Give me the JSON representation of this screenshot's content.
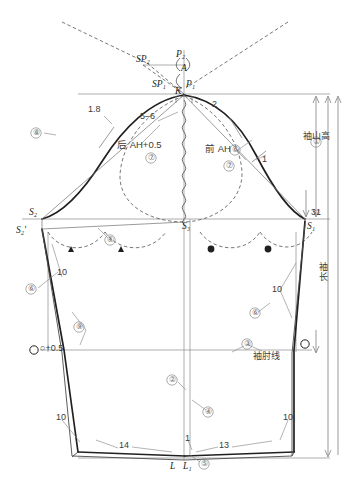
{
  "diagram": {
    "type": "sleeve-pattern-draft",
    "points": {
      "P2": "P₂",
      "A": "A",
      "SP2": "SP₂",
      "SP1": "SP₁",
      "P1": "P₁",
      "K": "K",
      "S2": "S₂",
      "S2p": "S₂'",
      "S3": "S₃",
      "S1": "S₁",
      "L": "L",
      "L1": "L₁"
    },
    "measurements": {
      "cap_left_offset": "1.8",
      "cap_right_offset": "2",
      "cap_top_seg": "5–6",
      "cap_right_lower": "1",
      "underarm_right": "31",
      "sleeve_left_upper": "10",
      "sleeve_right_upper": "10",
      "hem_left_10": "10",
      "hem_right_10": "10",
      "hem_left_width": "14",
      "hem_right_width": "13",
      "hem_center": "1",
      "circle_plus": "○+0.5"
    },
    "annotations": {
      "back_ah": "后 AH+0.5",
      "front_ah": "前 AH",
      "cap_height": "袖山高",
      "sleeve_length": "袖长",
      "elbow_line": "袖肘线"
    },
    "step_numbers": {
      "s1": "①",
      "s2": "②",
      "s3": "③",
      "s4": "④",
      "s4b": "④",
      "s5": "⑤",
      "s6": "⑥",
      "s6b": "⑥",
      "s6c": "⑥",
      "s7_back": "⑦",
      "s7_front": "⑦",
      "s8": "⑧",
      "s9": "⑨"
    },
    "colors": {
      "outline": "#231f20",
      "construction": "#6f6f6f",
      "dashed": "#4a4a4a",
      "text": "#231f20",
      "background": "#ffffff"
    }
  }
}
